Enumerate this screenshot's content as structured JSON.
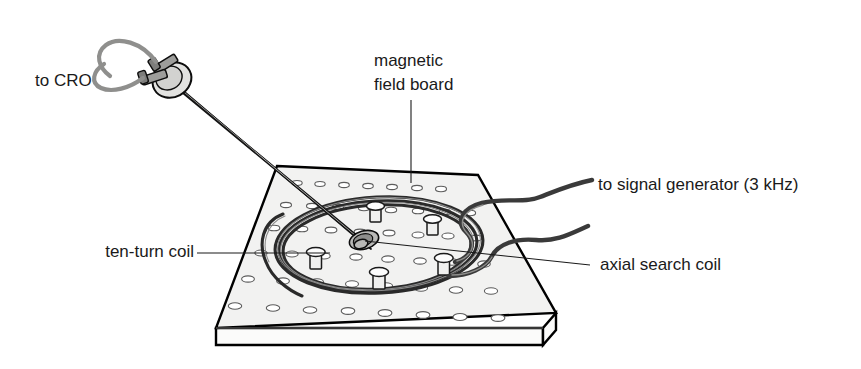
{
  "figure": {
    "background_color": "#ffffff",
    "width": 861,
    "height": 369
  },
  "labels": {
    "cro": "to CRO",
    "board_line1": "magnetic",
    "board_line2": "field board",
    "signal_generator": "to signal generator (3 kHz)",
    "ten_turn_coil": "ten-turn coil",
    "axial_search_coil": "axial search coil"
  },
  "components": {
    "board": {
      "name": "magnetic field board",
      "surface_color": "#f2f2f1",
      "outline_color": "#000000",
      "hole_rows": 7,
      "hole_columns": 7
    },
    "coil": {
      "name": "ten-turn coil",
      "turns": 10,
      "strand_color": "#2a2a2a"
    },
    "probe": {
      "name": "axial search coil probe",
      "rod_color": "#cfcfcd",
      "terminals": 2
    },
    "leads": {
      "name": "twisted pair to signal generator",
      "frequency": "3 kHz",
      "wire_color": "#3a3a3a"
    },
    "cro_leads": {
      "name": "wires to oscilloscope",
      "wire_color": "#8f8f8d"
    }
  },
  "pegs": [
    {
      "id": "peg-top",
      "x": 375,
      "y": 207
    },
    {
      "id": "peg-upper-right",
      "x": 432,
      "y": 219
    },
    {
      "id": "peg-left",
      "x": 316,
      "y": 252
    },
    {
      "id": "peg-lower-right",
      "x": 444,
      "y": 258
    },
    {
      "id": "peg-bottom",
      "x": 379,
      "y": 272
    }
  ]
}
